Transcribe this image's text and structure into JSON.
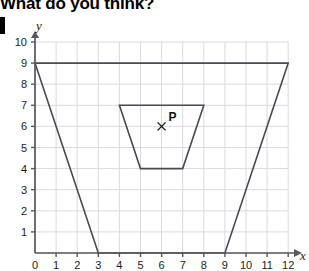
{
  "header": {
    "question_text": "What do you think?",
    "list_marker": "block-marker"
  },
  "chart_data": {
    "type": "scatter",
    "title": "",
    "xlabel": "x",
    "ylabel": "y",
    "xlim": [
      0,
      12
    ],
    "ylim": [
      0,
      10
    ],
    "grid": true,
    "grid_color": "#d9d9e2",
    "axis_color": "#58585f",
    "shape_color": "#4a4a52",
    "x_ticks": [
      0,
      1,
      2,
      3,
      4,
      5,
      6,
      7,
      8,
      9,
      10,
      11,
      12
    ],
    "y_ticks": [
      0,
      1,
      2,
      3,
      4,
      5,
      6,
      7,
      8,
      9,
      10
    ],
    "x_tick_labels": [
      "0",
      "1",
      "2",
      "3",
      "4",
      "5",
      "6",
      "7",
      "8",
      "9",
      "10",
      "11",
      "12"
    ],
    "y_tick_labels": [
      "0",
      "1",
      "2",
      "3",
      "4",
      "5",
      "6",
      "7",
      "8",
      "9",
      "10"
    ],
    "shapes": [
      {
        "name": "outer-trapezoid",
        "type": "polygon",
        "points": [
          [
            0,
            9
          ],
          [
            12,
            9
          ],
          [
            9,
            0
          ],
          [
            3,
            0
          ]
        ]
      },
      {
        "name": "inner-trapezoid",
        "type": "polygon",
        "points": [
          [
            4,
            7
          ],
          [
            8,
            7
          ],
          [
            7,
            4
          ],
          [
            5,
            4
          ]
        ]
      }
    ],
    "annotations": [
      {
        "name": "point-p",
        "label": "P",
        "marker": "cross",
        "x": 6,
        "y": 6
      }
    ]
  }
}
